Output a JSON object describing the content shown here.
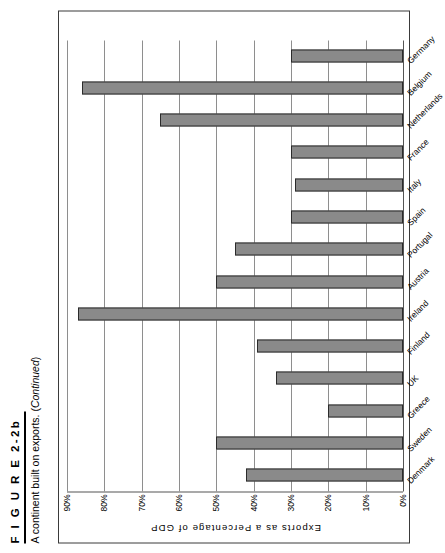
{
  "figure": {
    "number": "F I G U R E   2-2b",
    "caption_main": "A continent built on exports. (",
    "caption_italic": "Continued",
    "caption_end": ")"
  },
  "chart_data": {
    "type": "bar",
    "orientation": "horizontal",
    "title": "",
    "xlabel": "",
    "ylabel": "Exports  as  a  Percentage  of  GDP",
    "ylim": [
      0,
      90
    ],
    "grid": true,
    "legend": false,
    "bar_color": "#8a8a8a",
    "bar_border_color": "#2b2b2b",
    "tick_labels": [
      "90%",
      "80%",
      "70%",
      "60%",
      "50%",
      "40%",
      "30%",
      "20%",
      "10%",
      "0%"
    ],
    "tick_values": [
      90,
      80,
      70,
      60,
      50,
      40,
      30,
      20,
      10,
      0
    ],
    "categories": [
      "Denmark",
      "Sweden",
      "Greece",
      "UK",
      "Finland",
      "Ireland",
      "Austria",
      "Portugal",
      "Spain",
      "Italy",
      "France",
      "Netherlands",
      "Belgium",
      "Germany"
    ],
    "values": [
      42,
      50,
      20,
      34,
      39,
      87,
      50,
      45,
      30,
      29,
      30,
      65,
      86,
      30
    ]
  }
}
